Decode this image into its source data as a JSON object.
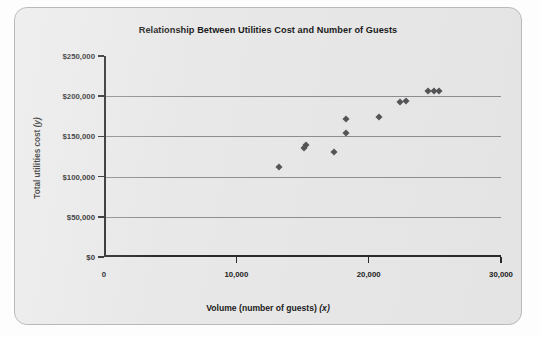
{
  "chart_data": {
    "type": "scatter",
    "title": "Relationship Between Utilities Cost and Number of Guests",
    "xlabel": "Volume (number of guests)",
    "xlabel_var": "(x)",
    "ylabel": "Total utilities cost",
    "ylabel_var": "(y)",
    "xlim": [
      0,
      30000
    ],
    "ylim": [
      0,
      250000
    ],
    "xticks": [
      0,
      10000,
      20000,
      30000
    ],
    "xtick_labels": [
      "0",
      "10,000",
      "20,000",
      "30,000"
    ],
    "yticks": [
      0,
      50000,
      100000,
      150000,
      200000,
      250000
    ],
    "ytick_labels": [
      "$0",
      "$50,000",
      "$100,000",
      "$150,000",
      "$200,000",
      "$250,000"
    ],
    "grid": "horizontal",
    "legend": null,
    "marker": "diamond",
    "marker_color": "#555557",
    "points": [
      {
        "x": 13200,
        "y": 112000
      },
      {
        "x": 15100,
        "y": 136000
      },
      {
        "x": 15300,
        "y": 139000
      },
      {
        "x": 17400,
        "y": 131000
      },
      {
        "x": 18300,
        "y": 154000
      },
      {
        "x": 18300,
        "y": 172000
      },
      {
        "x": 20800,
        "y": 174000
      },
      {
        "x": 22400,
        "y": 193000
      },
      {
        "x": 22800,
        "y": 194000
      },
      {
        "x": 24500,
        "y": 206000
      },
      {
        "x": 24900,
        "y": 207000
      },
      {
        "x": 25300,
        "y": 207000
      }
    ]
  },
  "panel": {
    "background": "#e8e8e8",
    "border_color": "#b9b9b9"
  }
}
